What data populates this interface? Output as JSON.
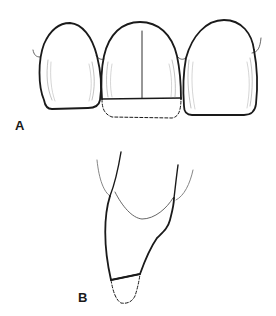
{
  "figure": {
    "panels": [
      {
        "id": "A",
        "label": "A",
        "description": "Three maxillary anterior teeth, labial view; central incisor with incisal reduction outlined (dashed)"
      },
      {
        "id": "B",
        "label": "B",
        "description": "Incisor in lateral (proximal) view with incisal reduction outlined (dashed)"
      }
    ],
    "colors": {
      "stroke": "#1a1a1a",
      "fine_stroke": "#8a8a8a",
      "background": "#ffffff"
    }
  }
}
